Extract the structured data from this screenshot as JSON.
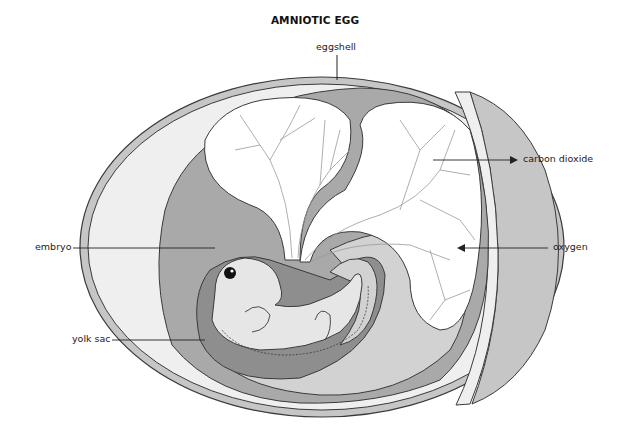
{
  "title": "AMNIOTIC EGG",
  "labels": {
    "eggshell": "eggshell",
    "carbon_dioxide": "carbon dioxide",
    "oxygen": "oxygen",
    "embryo": "embryo",
    "yolk_sac": "yolk sac"
  },
  "colors": {
    "shell": "#c6c6c6",
    "albumen": "#efefef",
    "chorion_band": "#a9a9a9",
    "amnion_fluid": "#d2d2d2",
    "yolk_sac": "#8e8e8e",
    "embryo": "#e6e6e6",
    "allantois": "#ffffff",
    "outline": "#3a3a3a"
  }
}
